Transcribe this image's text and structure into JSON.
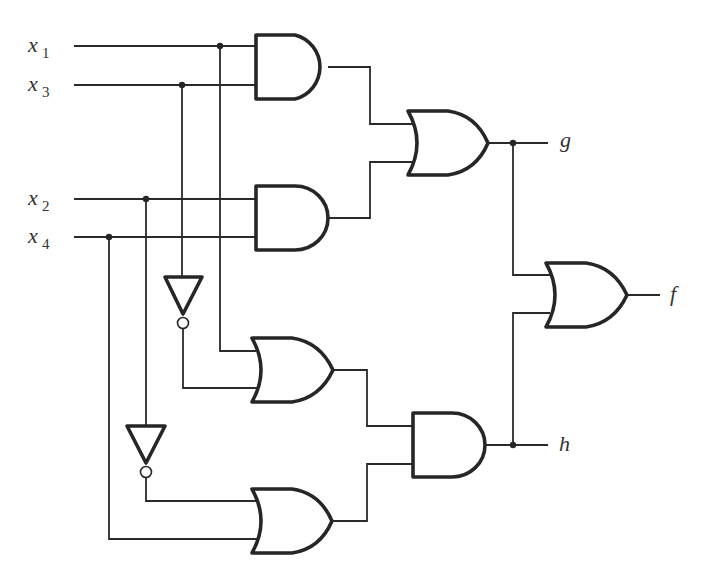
{
  "diagram": {
    "type": "logic-circuit",
    "inputs": [
      {
        "name": "x",
        "sub": "1",
        "y": 46
      },
      {
        "name": "x",
        "sub": "3",
        "y": 85
      },
      {
        "name": "x",
        "sub": "2",
        "y": 199
      },
      {
        "name": "x",
        "sub": "4",
        "y": 237
      }
    ],
    "outputs": [
      {
        "name": "g"
      },
      {
        "name": "f"
      },
      {
        "name": "h"
      }
    ],
    "gates": [
      {
        "id": "and1",
        "type": "AND",
        "inputs": [
          "x1",
          "x3"
        ]
      },
      {
        "id": "and2",
        "type": "AND",
        "inputs": [
          "x2",
          "x4"
        ]
      },
      {
        "id": "or1",
        "type": "OR",
        "inputs": [
          "and1",
          "and2"
        ],
        "output": "g"
      },
      {
        "id": "not1",
        "type": "NOT",
        "inputs": [
          "x3"
        ]
      },
      {
        "id": "not2",
        "type": "NOT",
        "inputs": [
          "x2"
        ]
      },
      {
        "id": "or2",
        "type": "OR",
        "inputs": [
          "x1",
          "not1"
        ]
      },
      {
        "id": "or3",
        "type": "OR",
        "inputs": [
          "not2",
          "x4"
        ]
      },
      {
        "id": "and3",
        "type": "AND",
        "inputs": [
          "or2",
          "or3"
        ],
        "output": "h"
      },
      {
        "id": "or4",
        "type": "OR",
        "inputs": [
          "g",
          "h"
        ],
        "output": "f"
      }
    ],
    "colors": {
      "line": "#262626",
      "background": "#ffffff",
      "text": "#333333"
    }
  }
}
